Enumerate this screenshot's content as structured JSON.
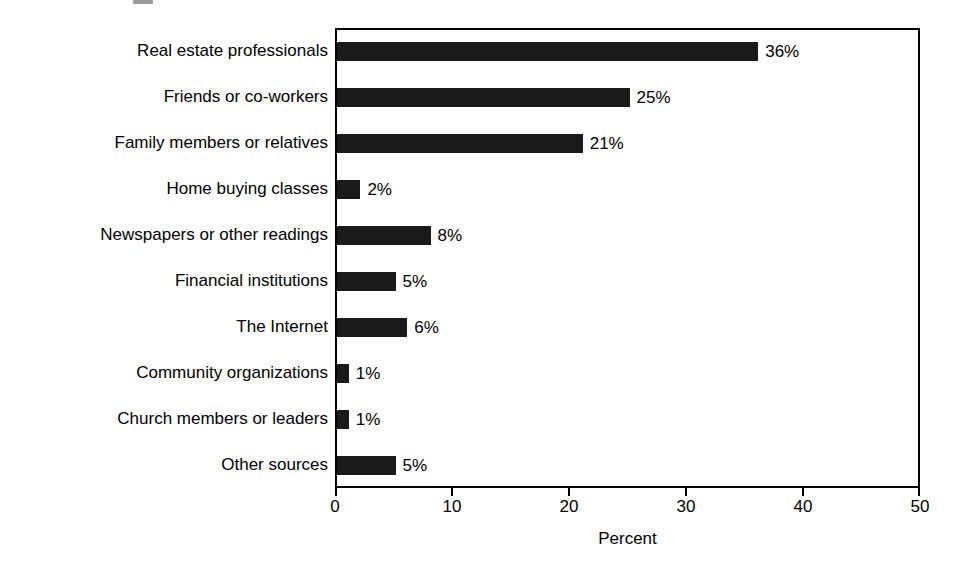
{
  "chart_data": {
    "type": "bar",
    "orientation": "horizontal",
    "title": "",
    "subtitle": "",
    "xlabel": "Percent",
    "ylabel": "",
    "xlim": [
      0,
      50
    ],
    "grid": false,
    "legend": null,
    "bar_color": "#1a1a1a",
    "axis_color": "#000000",
    "background": "#ffffff",
    "x_ticks": [
      0,
      10,
      20,
      30,
      40,
      50
    ],
    "x_tick_labels": [
      "0",
      "10",
      "20",
      "30",
      "40",
      "50"
    ],
    "categories": [
      "Real estate professionals",
      "Friends or co-workers",
      "Family members or relatives",
      "Home buying classes",
      "Newspapers or other readings",
      "Financial institutions",
      "The Internet",
      "Community organizations",
      "Church members or leaders",
      "Other sources"
    ],
    "values": [
      36,
      25,
      21,
      2,
      8,
      5,
      6,
      1,
      1,
      5
    ],
    "value_labels": [
      "36%",
      "25%",
      "21%",
      "2%",
      "8%",
      "5%",
      "6%",
      "1%",
      "1%",
      "5%"
    ]
  }
}
